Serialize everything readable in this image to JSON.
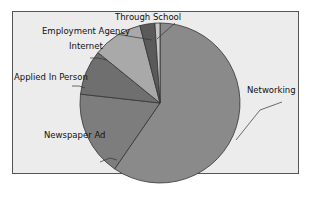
{
  "title": "",
  "chart_data": {
    "type": "pie",
    "title": "",
    "categories": [
      "Networking",
      "Newspaper Ad",
      "Applied In Person",
      "Internet",
      "Employment Agency",
      "Through School"
    ],
    "values": [
      59,
      17,
      9,
      10,
      3,
      1
    ],
    "unit": "percent (estimated)",
    "colors": [
      "#8a8a8a",
      "#7d7d7d",
      "#6f6f6f",
      "#a9a9a9",
      "#5a5a5a",
      "#c8c8c8"
    ],
    "start_angle": "12 o'clock",
    "direction": "clockwise",
    "legend": "none (leader-line labels)"
  },
  "labels": {
    "networking": "Networking",
    "newspaper": "Newspaper Ad",
    "applied": "Applied In Person",
    "internet": "Internet",
    "agency": "Employment Agency",
    "school": "Through School"
  }
}
